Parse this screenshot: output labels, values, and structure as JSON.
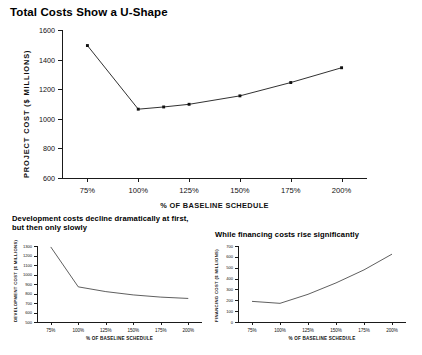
{
  "main_title": "Total Costs Show a U-Shape",
  "left_title": "Development costs decline dramatically at first, but then only slowly",
  "right_title": "While financing costs rise significantly",
  "chart_data": [
    {
      "id": "total-cost",
      "type": "line",
      "title": "Total Costs Show a U-Shape",
      "xlabel": "% OF BASELINE SCHEDULE",
      "ylabel": "PROJECT COST ($ MILLIONS)",
      "x": [
        75,
        100,
        112.5,
        125,
        150,
        175,
        200
      ],
      "values": [
        1495,
        1065,
        1080,
        1098,
        1155,
        1245,
        1345
      ],
      "xticks": [
        75,
        100,
        125,
        150,
        175,
        200
      ],
      "xticklabels": [
        "75%",
        "100%",
        "125%",
        "150%",
        "175%",
        "200%"
      ],
      "yticks": [
        600,
        800,
        1000,
        1200,
        1400,
        1600
      ],
      "yticklabels": [
        "600",
        "800",
        "1000",
        "1200",
        "1400",
        "1600"
      ],
      "xlim": [
        62.5,
        212.5
      ],
      "ylim": [
        600,
        1600
      ],
      "markers": true,
      "grid": false,
      "legend": "none",
      "line_color": "#1a1a1a"
    },
    {
      "id": "development-cost",
      "type": "line",
      "title": "Development costs decline dramatically at first, but then only slowly",
      "xlabel": "% OF BASELINE SCHEDULE",
      "ylabel": "DEVELOPMENT COST ($ MILLIONS)",
      "x": [
        75,
        100,
        125,
        150,
        175,
        200
      ],
      "values": [
        1290,
        870,
        820,
        785,
        762,
        748
      ],
      "xticks": [
        75,
        100,
        125,
        150,
        175,
        200
      ],
      "xticklabels": [
        "75%",
        "100%",
        "125%",
        "150%",
        "175%",
        "200%"
      ],
      "yticks": [
        500,
        600,
        700,
        800,
        900,
        1000,
        1100,
        1200,
        1300
      ],
      "yticklabels": [
        "500",
        "600",
        "700",
        "800",
        "900",
        "1000",
        "1100",
        "1200",
        "1300"
      ],
      "xlim": [
        62.5,
        212.5
      ],
      "ylim": [
        500,
        1300
      ],
      "markers": false,
      "grid": false,
      "legend": "none",
      "line_color": "#1a1a1a"
    },
    {
      "id": "financing-cost",
      "type": "line",
      "title": "While financing costs rise significantly",
      "xlabel": "% OF BASELINE SCHEDULE",
      "ylabel": "FINANCING COST ($ MILLIONS)",
      "x": [
        75,
        100,
        125,
        150,
        175,
        200
      ],
      "values": [
        190,
        172,
        255,
        360,
        480,
        625
      ],
      "xticks": [
        75,
        100,
        125,
        150,
        175,
        200
      ],
      "xticklabels": [
        "75%",
        "100%",
        "125%",
        "150%",
        "175%",
        "200%"
      ],
      "yticks": [
        0,
        100,
        200,
        300,
        400,
        500,
        600,
        700
      ],
      "yticklabels": [
        "0",
        "100",
        "200",
        "300",
        "400",
        "500",
        "600",
        "700"
      ],
      "xlim": [
        62.5,
        212.5
      ],
      "ylim": [
        0,
        700
      ],
      "markers": false,
      "grid": false,
      "legend": "none",
      "line_color": "#1a1a1a"
    }
  ]
}
